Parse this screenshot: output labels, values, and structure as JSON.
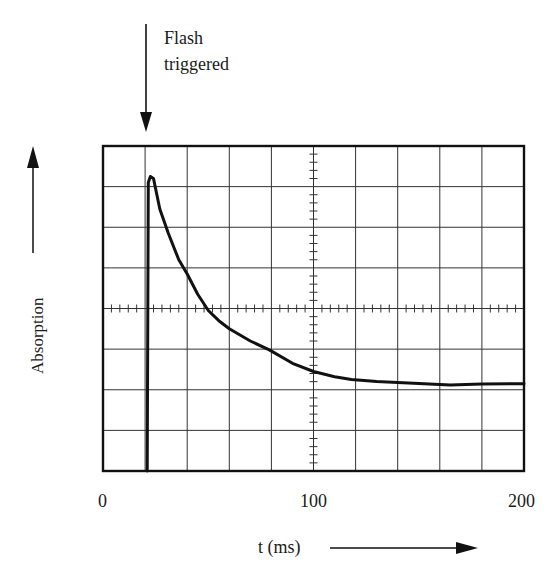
{
  "chart_data": {
    "type": "line",
    "title": "",
    "xlabel": "t (ms)",
    "ylabel": "Absorption",
    "xlim": [
      0,
      200
    ],
    "ylim": [
      0,
      8
    ],
    "x_ticks": [
      {
        "value": 0,
        "label": "0"
      },
      {
        "value": 100,
        "label": "100"
      },
      {
        "value": 200,
        "label": "200"
      }
    ],
    "grid": {
      "on": true,
      "x_divisions": 10,
      "y_divisions": 8,
      "minor_ticks_per_division": 5,
      "crosshair_minor_ticks": true
    },
    "annotations": [
      {
        "text": "Flash triggered",
        "lines": [
          "Flash",
          "triggered"
        ],
        "x": 21,
        "type": "downward-arrow"
      }
    ],
    "series": [
      {
        "name": "absorption-transient",
        "x": [
          0,
          21,
          21,
          21.5,
          22.5,
          24,
          27,
          31,
          36,
          40,
          45,
          50,
          55,
          60,
          70,
          79,
          90,
          100,
          110,
          118,
          130,
          140,
          155,
          165,
          180,
          200
        ],
        "y": [
          0,
          0,
          0,
          7.1,
          7.25,
          7.2,
          6.45,
          5.85,
          5.2,
          4.85,
          4.35,
          3.95,
          3.7,
          3.5,
          3.2,
          2.98,
          2.65,
          2.45,
          2.32,
          2.25,
          2.2,
          2.18,
          2.14,
          2.12,
          2.14,
          2.15
        ],
        "color": "#111111"
      }
    ],
    "legend": null
  },
  "labels": {
    "flash_line1": "Flash",
    "flash_line2": "triggered",
    "ylabel": "Absorption",
    "xlabel": "t (ms)",
    "tick_0": "0",
    "tick_100": "100",
    "tick_200": "200"
  }
}
